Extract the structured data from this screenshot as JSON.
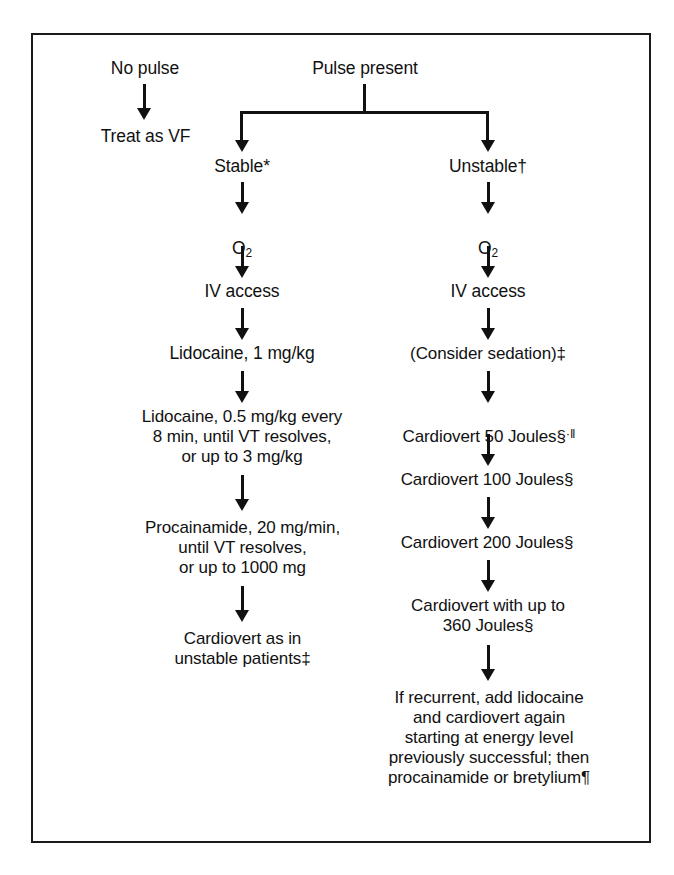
{
  "figure": {
    "border_color": "#1a1a1a",
    "ink_color": "#111111",
    "background_color": "#ffffff"
  },
  "no_pulse_branch": {
    "entry_label": "No pulse",
    "action_label": "Treat as VF"
  },
  "pulse_branch": {
    "entry_label": "Pulse present",
    "stable_label": "Stable*",
    "unstable_label": "Unstable†"
  },
  "stable_column": {
    "oxygen_label": "O",
    "oxygen_subscript": "2",
    "iv_access_label": "IV access",
    "step_lidocaine_bolus": "Lidocaine, 1 mg/kg",
    "step_lidocaine_repeat": "Lidocaine, 0.5 mg/kg every\n8 min, until VT resolves,\nor up to 3 mg/kg",
    "step_procainamide": "Procainamide, 20 mg/min,\nuntil VT resolves,\nor up to 1000 mg",
    "step_cardiovert": "Cardiovert as in\nunstable patients‡"
  },
  "unstable_column": {
    "oxygen_label": "O",
    "oxygen_subscript": "2",
    "iv_access_label": "IV access",
    "step_sedation": "(Consider sedation)‡",
    "step_cardiovert_50": "Cardiovert 50 Joules§",
    "step_cardiovert_50_marks": "·‖",
    "step_cardiovert_100": "Cardiovert 100 Joules§",
    "step_cardiovert_200": "Cardiovert 200 Joules§",
    "step_cardiovert_360": "Cardiovert with up to\n360 Joules§",
    "step_recurrent": "If recurrent, add lidocaine\nand cardiovert again\nstarting at energy level\npreviously successful; then\nprocainamide or bretylium¶"
  }
}
